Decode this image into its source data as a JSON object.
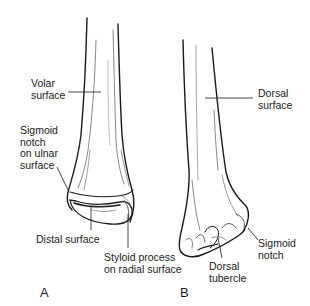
{
  "figure": {
    "panels": [
      {
        "id": "A",
        "letter": "A",
        "view": "volar",
        "labels": [
          {
            "key": "volar_surface",
            "text": "Volar\nsurface"
          },
          {
            "key": "sigmoid_notch_ulnar",
            "text": "Sigmoid\nnotch\non ulnar\nsurface"
          },
          {
            "key": "distal_surface",
            "text": "Distal surface"
          },
          {
            "key": "styloid_process",
            "text": "Styloid process\non radial surface"
          }
        ]
      },
      {
        "id": "B",
        "letter": "B",
        "view": "dorsal",
        "labels": [
          {
            "key": "dorsal_surface",
            "text": "Dorsal\nsurface"
          },
          {
            "key": "sigmoid_notch",
            "text": "Sigmoid\nnotch"
          },
          {
            "key": "dorsal_tubercle",
            "text": "Dorsal\ntubercle"
          }
        ]
      }
    ],
    "colors": {
      "line": "#1a1a1a",
      "shade": "#555555",
      "background": "#ffffff"
    }
  }
}
